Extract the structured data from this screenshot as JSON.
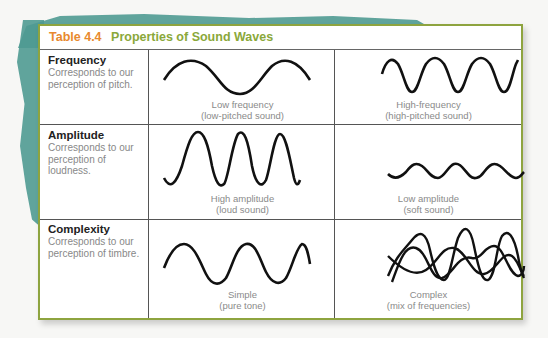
{
  "table": {
    "number": "Table 4.4",
    "title": "Properties of Sound Waves",
    "colors": {
      "number": "#e8892e",
      "title": "#8aa83a",
      "border": "#8ea43f",
      "brush": "#4f9a92"
    },
    "rows": [
      {
        "term": "Frequency",
        "description": "Corresponds to our perception of pitch.",
        "left": {
          "icon": "low-frequency-wave",
          "caption_line1": "Low frequency",
          "caption_line2": "(low-pitched sound)"
        },
        "right": {
          "icon": "high-frequency-wave",
          "caption_line1": "High-frequency",
          "caption_line2": "(high-pitched sound)"
        }
      },
      {
        "term": "Amplitude",
        "description": "Corresponds to our perception of loudness.",
        "left": {
          "icon": "high-amplitude-wave",
          "caption_line1": "High amplitude",
          "caption_line2": "(loud sound)"
        },
        "right": {
          "icon": "low-amplitude-wave",
          "caption_line1": "Low amplitude",
          "caption_line2": "(soft sound)"
        }
      },
      {
        "term": "Complexity",
        "description": "Corresponds to our perception of timbre.",
        "left": {
          "icon": "simple-wave",
          "caption_line1": "Simple",
          "caption_line2": "(pure tone)"
        },
        "right": {
          "icon": "complex-wave",
          "caption_line1": "Complex",
          "caption_line2": "(mix of frequencies)"
        }
      }
    ]
  }
}
